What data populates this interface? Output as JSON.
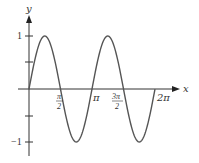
{
  "chart_data": {
    "type": "line",
    "title": "",
    "function": "y = sin(2x)",
    "xlabel": "x",
    "ylabel": "y",
    "xlim": [
      0,
      6.283
    ],
    "ylim": [
      -1,
      1
    ],
    "grid": false,
    "x_ticks": [
      {
        "value": 1.5708,
        "label_num": "π",
        "label_den": "2"
      },
      {
        "value": 3.1416,
        "label": "π"
      },
      {
        "value": 4.7124,
        "label_num": "3π",
        "label_den": "2"
      },
      {
        "value": 6.2832,
        "label": "2π"
      }
    ],
    "y_ticks": [
      {
        "value": 1,
        "label": "1"
      },
      {
        "value": 0.5,
        "label": ""
      },
      {
        "value": -0.5,
        "label": ""
      },
      {
        "value": -1,
        "label": "−1"
      }
    ],
    "series": [
      {
        "name": "sin(2x)",
        "x": [
          0,
          0.785,
          1.571,
          2.356,
          3.142,
          3.927,
          4.712,
          5.498,
          6.283
        ],
        "values": [
          0,
          1,
          0,
          -1,
          0,
          1,
          0,
          -1,
          0
        ]
      }
    ],
    "color": "#555555"
  },
  "labels": {
    "x_axis": "x",
    "y_axis": "y",
    "y_one": "1",
    "y_neg_one": "−1",
    "pi_half_num": "π",
    "pi_half_den": "2",
    "pi": "π",
    "three_pi_half_num": "3π",
    "three_pi_half_den": "2",
    "two_pi": "2π"
  }
}
